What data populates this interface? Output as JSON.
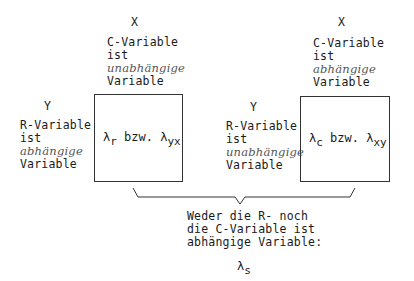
{
  "left": {
    "col_var": "X",
    "col_lines": [
      "C-Variable",
      "ist",
      "unabhängige",
      "Variable"
    ],
    "row_var": "Y",
    "row_lines": [
      "R-Variable",
      "ist",
      "abhängige",
      "Variable"
    ],
    "box": {
      "lambda1_sub": "r",
      "connector": "bzw.",
      "lambda2_sub": "yx"
    }
  },
  "right": {
    "col_var": "X",
    "col_lines": [
      "C-Variable",
      "ist",
      "abhängige",
      "Variable"
    ],
    "row_var": "Y",
    "row_lines": [
      "R-Variable",
      "ist",
      "unabhängige",
      "Variable"
    ],
    "box": {
      "lambda1_sub": "c",
      "connector": "bzw.",
      "lambda2_sub": "xy"
    }
  },
  "bottom": {
    "lines": [
      "Weder die R- noch",
      "die C-Variable ist",
      "abhängige Variable:"
    ],
    "lambda_sub": "s"
  },
  "symbols": {
    "lambda": "λ"
  }
}
